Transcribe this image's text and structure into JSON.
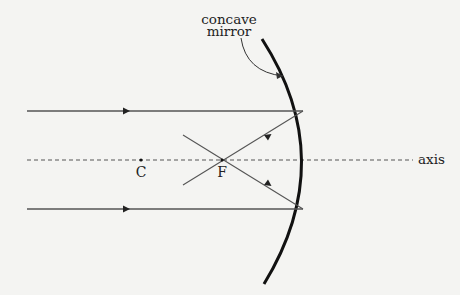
{
  "diagram": {
    "labels": {
      "mirror_line1": "concave",
      "mirror_line2": "mirror",
      "center": "C",
      "focus": "F",
      "axis": "axis"
    },
    "colors": {
      "background": "#f4f4f2",
      "mirror": "#111111",
      "ray": "#555555",
      "text": "#222222"
    }
  }
}
